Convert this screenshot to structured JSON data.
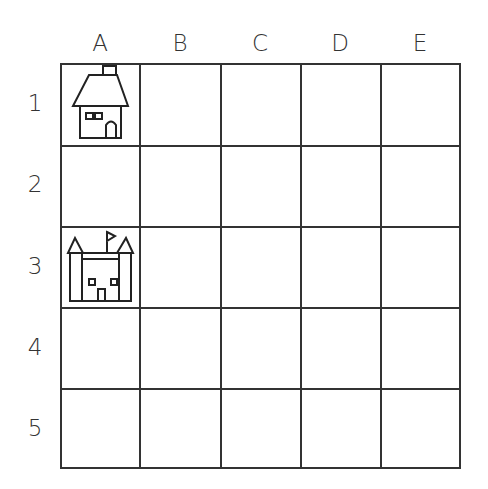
{
  "grid": {
    "columns": [
      "A",
      "B",
      "C",
      "D",
      "E"
    ],
    "rows": [
      "1",
      "2",
      "3",
      "4",
      "5"
    ]
  },
  "items": [
    {
      "name": "house",
      "cell": "A1",
      "icon": "house-icon"
    },
    {
      "name": "castle",
      "cell": "A3",
      "icon": "castle-icon"
    }
  ],
  "colors": {
    "line": "#333333",
    "background": "#ffffff"
  }
}
